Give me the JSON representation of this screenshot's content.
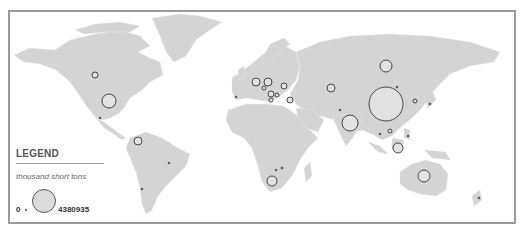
{
  "legend": {
    "title": "LEGEND",
    "unit": "thousand short tons",
    "min_label": "0",
    "max_label": "4380935"
  },
  "colors": {
    "land": "#d4d4d4",
    "bubble_fill": "#e2e2e2",
    "bubble_stroke": "#444444",
    "frame": "#9a9a9a"
  },
  "bubbles": [
    {
      "region": "China",
      "cx": 386,
      "cy": 104,
      "r": 17
    },
    {
      "region": "USA",
      "cx": 109,
      "cy": 101,
      "r": 7
    },
    {
      "region": "India",
      "cx": 350,
      "cy": 123,
      "r": 8
    },
    {
      "region": "Russia (Kuzbass)",
      "cx": 386,
      "cy": 66,
      "r": 6
    },
    {
      "region": "Australia",
      "cx": 424,
      "cy": 176,
      "r": 6
    },
    {
      "region": "Indonesia",
      "cx": 398,
      "cy": 148,
      "r": 5
    },
    {
      "region": "South Africa",
      "cx": 272,
      "cy": 181,
      "r": 5
    },
    {
      "region": "Colombia",
      "cx": 138,
      "cy": 141,
      "r": 4
    },
    {
      "region": "Canada",
      "cx": 95,
      "cy": 75,
      "r": 3
    },
    {
      "region": "Germany",
      "cx": 256,
      "cy": 82,
      "r": 4
    },
    {
      "region": "Poland",
      "cx": 268,
      "cy": 82,
      "r": 4
    },
    {
      "region": "Ukraine",
      "cx": 284,
      "cy": 86,
      "r": 3
    },
    {
      "region": "Kazakhstan",
      "cx": 331,
      "cy": 88,
      "r": 4
    },
    {
      "region": "Turkey",
      "cx": 290,
      "cy": 100,
      "r": 3
    },
    {
      "region": "Serbia",
      "cx": 271,
      "cy": 94,
      "r": 3
    },
    {
      "region": "Bulgaria",
      "cx": 277,
      "cy": 95,
      "r": 2
    },
    {
      "region": "Greece",
      "cx": 271,
      "cy": 100,
      "r": 2
    },
    {
      "region": "Czechia",
      "cx": 264,
      "cy": 88,
      "r": 2
    },
    {
      "region": "Korea",
      "cx": 415,
      "cy": 101,
      "r": 2
    },
    {
      "region": "Vietnam",
      "cx": 390,
      "cy": 131,
      "r": 2
    },
    {
      "region": "Mexico",
      "cx": 100,
      "cy": 118,
      "r": 1
    },
    {
      "region": "Brazil",
      "cx": 169,
      "cy": 163,
      "r": 1
    },
    {
      "region": "Chile",
      "cx": 142,
      "cy": 189,
      "r": 1
    },
    {
      "region": "Spain",
      "cx": 236,
      "cy": 97,
      "r": 1
    },
    {
      "region": "Zimbabwe",
      "cx": 276,
      "cy": 170,
      "r": 1
    },
    {
      "region": "Mozambique",
      "cx": 282,
      "cy": 168,
      "r": 1
    },
    {
      "region": "Pakistan",
      "cx": 340,
      "cy": 110,
      "r": 1
    },
    {
      "region": "Mongolia",
      "cx": 397,
      "cy": 87,
      "r": 1
    },
    {
      "region": "Japan",
      "cx": 430,
      "cy": 104,
      "r": 1
    },
    {
      "region": "Thailand",
      "cx": 380,
      "cy": 134,
      "r": 1
    },
    {
      "region": "Philippines",
      "cx": 408,
      "cy": 136,
      "r": 1
    },
    {
      "region": "New Zealand",
      "cx": 479,
      "cy": 198,
      "r": 1
    }
  ]
}
